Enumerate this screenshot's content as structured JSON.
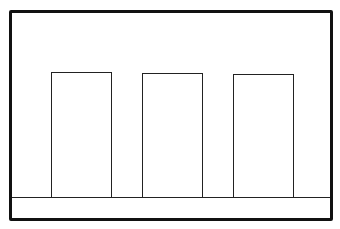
{
  "diagram": {
    "colors": {
      "stroke": "#111111",
      "fill": "#ffffff"
    },
    "frame": {
      "x": 9,
      "y": 10,
      "width": 324,
      "height": 211
    },
    "baseline_y": 197,
    "bars": [
      {
        "id": "bar-1",
        "x": 51,
        "y": 72,
        "width": 61,
        "height": 125
      },
      {
        "id": "bar-2",
        "x": 142,
        "y": 73,
        "width": 61,
        "height": 124
      },
      {
        "id": "bar-3",
        "x": 233,
        "y": 74,
        "width": 61,
        "height": 123
      }
    ]
  }
}
